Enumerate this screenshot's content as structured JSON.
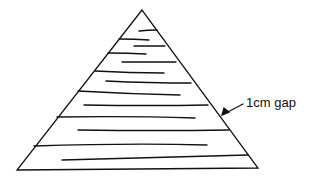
{
  "diagram": {
    "shape": "triangle",
    "annotation": {
      "label": "1cm gap",
      "arrow": "left-down"
    },
    "stroke_color": "#111111",
    "background": "#ffffff"
  }
}
